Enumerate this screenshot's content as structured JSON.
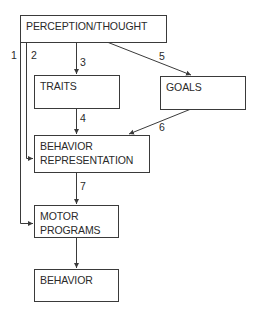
{
  "diagram": {
    "type": "flowchart",
    "nodes": {
      "perception": {
        "lines": [
          "PERCEPTION/THOUGHT"
        ]
      },
      "traits": {
        "lines": [
          "TRAITS"
        ]
      },
      "goals": {
        "lines": [
          "GOALS"
        ]
      },
      "behavior_representation": {
        "lines": [
          "BEHAVIOR",
          "REPRESENTATION"
        ]
      },
      "motor_programs": {
        "lines": [
          "MOTOR",
          "PROGRAMS"
        ]
      },
      "behavior": {
        "lines": [
          "BEHAVIOR"
        ]
      }
    },
    "edges": [
      {
        "id": "1",
        "label": "1",
        "from": "PERCEPTION/THOUGHT",
        "to": "MOTOR PROGRAMS"
      },
      {
        "id": "2",
        "label": "2",
        "from": "PERCEPTION/THOUGHT",
        "to": "BEHAVIOR REPRESENTATION"
      },
      {
        "id": "3",
        "label": "3",
        "from": "PERCEPTION/THOUGHT",
        "to": "TRAITS"
      },
      {
        "id": "4",
        "label": "4",
        "from": "TRAITS",
        "to": "BEHAVIOR REPRESENTATION"
      },
      {
        "id": "5",
        "label": "5",
        "from": "PERCEPTION/THOUGHT",
        "to": "GOALS"
      },
      {
        "id": "6",
        "label": "6",
        "from": "GOALS",
        "to": "BEHAVIOR REPRESENTATION"
      },
      {
        "id": "7",
        "label": "7",
        "from": "BEHAVIOR REPRESENTATION",
        "to": "MOTOR PROGRAMS"
      },
      {
        "id": "8",
        "label": "",
        "from": "MOTOR PROGRAMS",
        "to": "BEHAVIOR"
      }
    ],
    "colors": {
      "line": "#3a3a3a",
      "text": "#2a2a2a",
      "background": "#ffffff"
    }
  }
}
